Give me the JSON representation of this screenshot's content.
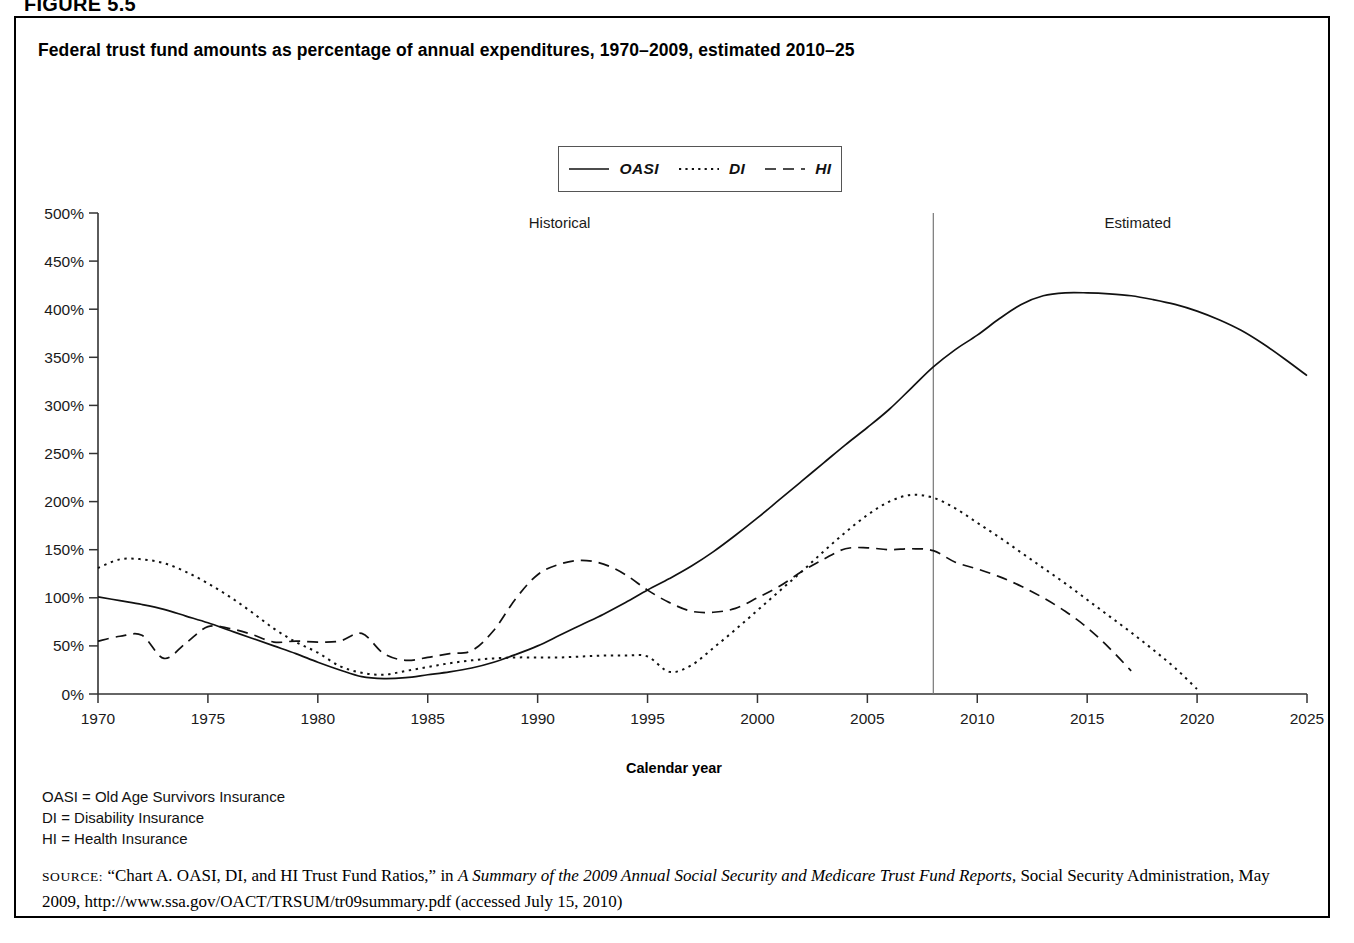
{
  "figure": {
    "label": "FIGURE 5.5"
  },
  "chart_title": "Federal trust fund amounts as percentage of annual expenditures, 1970–2009, estimated 2010–25",
  "legend": {
    "items": [
      {
        "label": "OASI",
        "style": "solid"
      },
      {
        "label": "DI",
        "style": "dotted"
      },
      {
        "label": "HI",
        "style": "dashed"
      }
    ]
  },
  "annotations": {
    "historical": "Historical",
    "estimated": "Estimated",
    "divider_year": 2008
  },
  "abbreviations": [
    "OASI = Old Age Survivors Insurance",
    "DI = Disability Insurance",
    "HI = Health Insurance"
  ],
  "source": {
    "word": "SOURCE:",
    "text_1": " “Chart A. OASI, DI, and HI Trust Fund Ratios,” in ",
    "italic_1": "A Summary of the 2009 Annual Social Security and Medicare Trust Fund Reports",
    "text_2": ", Social Security Administration, May 2009, http://www.ssa.gov/OACT/TRSUM/tr09summary.pdf (accessed July 15, 2010)"
  },
  "chart_data": {
    "type": "line",
    "title": "Federal trust fund amounts as percentage of annual expenditures, 1970–2009, estimated 2010–25",
    "xlabel": "Calendar year",
    "ylabel": "",
    "xlim": [
      1970,
      2025
    ],
    "ylim": [
      0,
      500
    ],
    "ytick_labels": [
      "0%",
      "50%",
      "100%",
      "150%",
      "200%",
      "250%",
      "300%",
      "350%",
      "400%",
      "450%",
      "500%"
    ],
    "ytick_values": [
      0,
      50,
      100,
      150,
      200,
      250,
      300,
      350,
      400,
      450,
      500
    ],
    "xtick_values": [
      1970,
      1975,
      1980,
      1985,
      1990,
      1995,
      2000,
      2005,
      2010,
      2015,
      2020,
      2025
    ],
    "xtick_labels": [
      "1970",
      "1975",
      "1980",
      "1985",
      "1990",
      "1995",
      "2000",
      "2005",
      "2010",
      "2015",
      "2020",
      "2025"
    ],
    "grid": false,
    "legend_position": "top-center",
    "units": "percent of annual expenditures",
    "series": [
      {
        "name": "OASI",
        "style": "solid",
        "x": [
          1970,
          1971,
          1972,
          1973,
          1974,
          1975,
          1976,
          1977,
          1978,
          1979,
          1980,
          1981,
          1982,
          1983,
          1984,
          1985,
          1986,
          1987,
          1988,
          1989,
          1990,
          1991,
          1992,
          1993,
          1994,
          1995,
          1996,
          1997,
          1998,
          1999,
          2000,
          2001,
          2002,
          2003,
          2004,
          2005,
          2006,
          2007,
          2008,
          2009,
          2010,
          2011,
          2012,
          2013,
          2014,
          2015,
          2016,
          2017,
          2018,
          2019,
          2020,
          2021,
          2022,
          2023,
          2024,
          2025
        ],
        "y": [
          101,
          97,
          93,
          88,
          81,
          74,
          66,
          58,
          50,
          42,
          33,
          25,
          18,
          16,
          17,
          20,
          23,
          27,
          33,
          41,
          50,
          61,
          72,
          83,
          95,
          108,
          120,
          133,
          148,
          165,
          183,
          202,
          221,
          240,
          259,
          277,
          296,
          318,
          340,
          358,
          373,
          390,
          405,
          414,
          417,
          417,
          416,
          414,
          410,
          405,
          398,
          389,
          378,
          364,
          348,
          331
        ]
      },
      {
        "name": "DI",
        "style": "dotted",
        "x": [
          1970,
          1971,
          1972,
          1973,
          1974,
          1975,
          1976,
          1977,
          1978,
          1979,
          1980,
          1981,
          1982,
          1983,
          1984,
          1985,
          1986,
          1987,
          1988,
          1989,
          1990,
          1991,
          1992,
          1993,
          1994,
          1995,
          1996,
          1997,
          1998,
          1999,
          2000,
          2001,
          2002,
          2003,
          2004,
          2005,
          2006,
          2007,
          2008,
          2009,
          2010,
          2011,
          2012,
          2013,
          2014,
          2015,
          2016,
          2017,
          2018,
          2019,
          2020
        ],
        "y": [
          131,
          140,
          140,
          136,
          127,
          115,
          101,
          85,
          68,
          54,
          43,
          29,
          22,
          20,
          24,
          28,
          32,
          35,
          37,
          38,
          38,
          38,
          39,
          40,
          40,
          39,
          23,
          30,
          48,
          67,
          87,
          107,
          127,
          148,
          168,
          186,
          200,
          207,
          204,
          193,
          178,
          163,
          147,
          131,
          115,
          98,
          81,
          64,
          46,
          27,
          5
        ]
      },
      {
        "name": "HI",
        "style": "dashed",
        "x": [
          1970,
          1971,
          1972,
          1973,
          1974,
          1975,
          1976,
          1977,
          1978,
          1979,
          1980,
          1981,
          1982,
          1983,
          1984,
          1985,
          1986,
          1987,
          1988,
          1989,
          1990,
          1991,
          1992,
          1993,
          1994,
          1995,
          1996,
          1997,
          1998,
          1999,
          2000,
          2001,
          2002,
          2003,
          2004,
          2005,
          2006,
          2007,
          2008,
          2009,
          2010,
          2011,
          2012,
          2013,
          2014,
          2015,
          2016,
          2017
        ],
        "y": [
          55,
          60,
          61,
          37,
          53,
          70,
          68,
          62,
          54,
          55,
          54,
          55,
          63,
          42,
          35,
          38,
          42,
          45,
          66,
          99,
          124,
          135,
          139,
          135,
          124,
          108,
          95,
          86,
          85,
          89,
          100,
          112,
          127,
          140,
          151,
          152,
          150,
          151,
          149,
          137,
          130,
          122,
          112,
          100,
          86,
          69,
          48,
          24
        ]
      }
    ]
  }
}
